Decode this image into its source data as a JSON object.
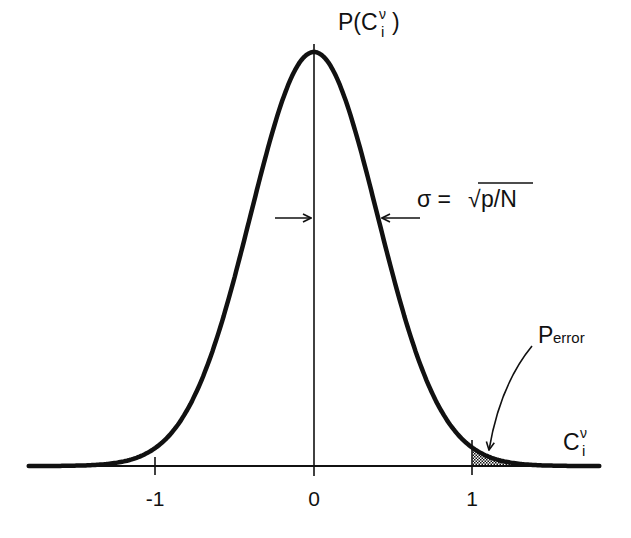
{
  "labels": {
    "y_axis": {
      "main": "P(C",
      "sub": "i",
      "sup": "ν",
      "close": ")"
    },
    "x_axis": {
      "main": "C",
      "sub": "i",
      "sup": "ν"
    },
    "sigma": {
      "lhs": "σ = ",
      "sqrt": "√",
      "radicand": "p/N"
    },
    "perror": {
      "main": "P",
      "sub": "error"
    }
  },
  "ticks": [
    {
      "value": -1,
      "label": "-1"
    },
    {
      "value": 0,
      "label": "0"
    },
    {
      "value": 1,
      "label": "1"
    }
  ],
  "colors": {
    "ink": "#111111",
    "background": "#ffffff"
  },
  "chart_data": {
    "type": "line",
    "title": "",
    "xlabel": "C_i^ν",
    "ylabel": "P(C_i^ν)",
    "x_ticks": [
      -1,
      0,
      1
    ],
    "xlim": [
      -1.8,
      1.8
    ],
    "series": [
      {
        "name": "Gaussian",
        "mean": 0,
        "sigma": 0.4,
        "sigma_formula": "σ = √(p/N)"
      }
    ],
    "shaded_region": {
      "name": "P_error",
      "from": 1,
      "to": "∞"
    },
    "annotations": [
      "σ = √p/N",
      "P_error"
    ]
  }
}
